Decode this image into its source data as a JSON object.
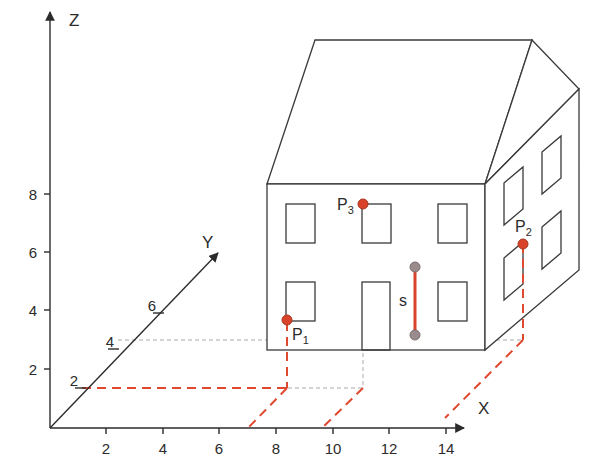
{
  "diagram": {
    "colors": {
      "axis": "#2b2b2b",
      "house_line": "#3a3a3a",
      "projection_red": "#e0482f",
      "guide_gray": "#a9a9a9",
      "point_red": "#d9432a",
      "point_gray": "#9a8c8c"
    },
    "axes": {
      "x": {
        "label": "X",
        "ticks": [
          "2",
          "4",
          "6",
          "8",
          "10",
          "12",
          "14"
        ]
      },
      "y": {
        "label": "Y",
        "ticks": [
          "2",
          "4",
          "6"
        ]
      },
      "z": {
        "label": "Z",
        "ticks": [
          "2",
          "4",
          "6",
          "8"
        ]
      }
    },
    "points": [
      {
        "id": "P1",
        "label": "P",
        "sub": "1"
      },
      {
        "id": "P2",
        "label": "P",
        "sub": "2"
      },
      {
        "id": "P3",
        "label": "P",
        "sub": "3"
      }
    ],
    "segment": {
      "label": "s"
    }
  }
}
